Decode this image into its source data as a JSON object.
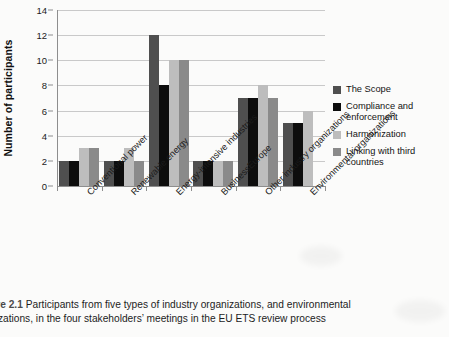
{
  "chart_data": {
    "type": "bar",
    "title": "",
    "xlabel": "",
    "ylabel": "Number of participants",
    "ylim": [
      0,
      14
    ],
    "yticks": [
      0,
      2,
      4,
      6,
      8,
      10,
      12,
      14
    ],
    "grid": true,
    "legend_position": "right",
    "categories": [
      "Conventional power",
      "Renewable energy",
      "Energy-intensive industries",
      "BusinessEurope",
      "Other industry organizations",
      "Environmental organizations"
    ],
    "series": [
      {
        "name": "The Scope",
        "color": "#4f4f4f",
        "values": [
          2,
          2,
          12,
          2,
          7,
          5
        ]
      },
      {
        "name": "Compliance and enforcement",
        "color": "#0d0d0d",
        "values": [
          2,
          2,
          8,
          2,
          7,
          5
        ]
      },
      {
        "name": "Harmonization",
        "color": "#bdbdbd",
        "values": [
          3,
          3,
          10,
          2,
          8,
          6
        ]
      },
      {
        "name": "Linking with third countries",
        "color": "#8a8a8a",
        "values": [
          3,
          2,
          10,
          2,
          7,
          0
        ]
      }
    ]
  },
  "legend": {
    "items": [
      {
        "label": "The Scope"
      },
      {
        "label": "Compliance and enforcement"
      },
      {
        "label": "Harmonization"
      },
      {
        "label": "Linking with third countries"
      }
    ]
  },
  "caption": {
    "figure_number": "ure 2.1",
    "line1": "Participants from five types of industry organizations, and environmental",
    "line2": "nizations, in the four stakeholders’ meetings in the EU ETS review process"
  }
}
